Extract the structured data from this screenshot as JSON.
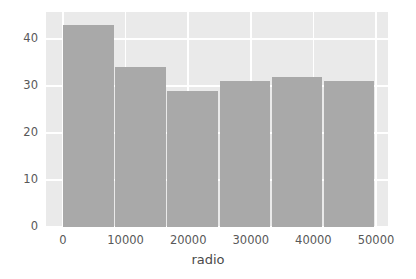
{
  "chart_data": {
    "type": "bar",
    "title": "",
    "subtitle": "",
    "xlabel": "radio",
    "ylabel": "",
    "categories": [
      "0-8333",
      "8333-16667",
      "16667-25000",
      "25000-33333",
      "33333-41667",
      "41667-50000"
    ],
    "bin_edges": [
      0,
      8333,
      16667,
      25000,
      33333,
      41667,
      50000
    ],
    "values": [
      43,
      34,
      29,
      31,
      32,
      31
    ],
    "xlim": [
      0,
      50000
    ],
    "ylim": [
      0,
      45.8
    ],
    "xticks": [
      0,
      10000,
      20000,
      30000,
      40000,
      50000
    ],
    "xticklabels": [
      "0",
      "10000",
      "20000",
      "30000",
      "40000",
      "50000"
    ],
    "yticks": [
      0,
      10,
      20,
      30,
      40
    ],
    "yticklabels": [
      "0",
      "10",
      "20",
      "30",
      "40"
    ],
    "grid": true,
    "grid_color": "#ffffff",
    "legend": null,
    "bar_color": "#a9a9a9",
    "plot_bgcolor": "#eaeaea",
    "figure_bgcolor": "#ffffff",
    "tick_color": "#585858"
  }
}
